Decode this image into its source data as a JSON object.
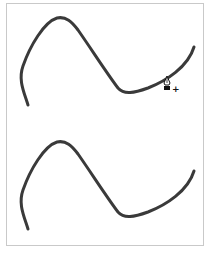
{
  "artboard": {
    "background": "#ffffff",
    "border_color": "#c9c9c9"
  },
  "paths": [
    {
      "name": "upper-wave-path",
      "stroke": "#3a3a3a",
      "stroke_width": 3,
      "d": "M 28 105 C 24 92, 18 80, 23 66 C 30 46, 44 22, 57 18 C 66 16, 72 22, 78 30 C 92 50, 106 72, 118 88 C 124 95, 134 93, 148 88 C 166 81, 188 67, 194 47"
    },
    {
      "name": "lower-wave-path",
      "stroke": "#3a3a3a",
      "stroke_width": 3,
      "d": "M 28 229 C 24 216, 18 204, 23 190 C 30 170, 44 146, 57 142 C 66 140, 72 146, 78 154 C 92 174, 106 196, 118 212 C 124 219, 134 217, 148 212 C 166 205, 188 191, 194 171"
    }
  ],
  "cursor": {
    "tool": "pen-add-anchor-point",
    "glyph_plus": "+",
    "x": 162,
    "y": 75
  }
}
